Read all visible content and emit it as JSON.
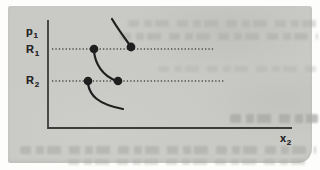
{
  "figure": {
    "y_axis_label": {
      "base": "p",
      "sub": "1"
    },
    "x_axis_label": {
      "base": "x",
      "sub": "2"
    },
    "row_labels": [
      {
        "base": "R",
        "sub": "1"
      },
      {
        "base": "R",
        "sub": "2"
      }
    ],
    "geometry": {
      "axes_path": "M48 20 L48 128 L292 128",
      "dotted_lines": [
        {
          "x1": 52,
          "y1": 49,
          "x2": 215,
          "y2": 49
        },
        {
          "x1": 52,
          "y1": 81,
          "x2": 225,
          "y2": 81
        }
      ],
      "curves": [
        {
          "d": "M112 19 Q118 29 129 44"
        },
        {
          "d": "M94 51 C95 63 102 76 117 81"
        },
        {
          "d": "M88 84 C90 95 97 104 123 109"
        }
      ],
      "points": [
        {
          "cx": 94,
          "cy": 49,
          "r": 4.3
        },
        {
          "cx": 131,
          "cy": 47,
          "r": 4.4
        },
        {
          "cx": 88,
          "cy": 81,
          "r": 4.3
        },
        {
          "cx": 118,
          "cy": 81,
          "r": 4.3
        }
      ]
    },
    "colors": {
      "ink": "#1f1f1f",
      "axis": "#3c3c3c",
      "dotted": "#4a4a4a",
      "paper": "#c9c9c6",
      "bleed": "#a8a8a5",
      "label": "#262626"
    }
  }
}
